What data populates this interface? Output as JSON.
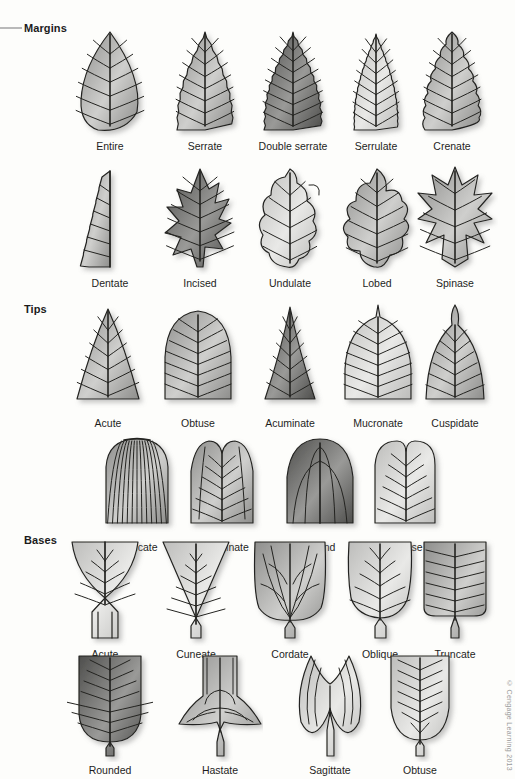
{
  "figure": {
    "background": "#fdfdfb",
    "ink": "#1d1d1d",
    "copyright": "© Cengage Learning 2013"
  },
  "sections": [
    {
      "id": "margins",
      "heading": "Margins",
      "rows": [
        {
          "id": "margins-row-1",
          "items": [
            {
              "label": "Entire",
              "shape": "entire",
              "tone": "mid"
            },
            {
              "label": "Serrate",
              "shape": "serrate",
              "tone": "mid"
            },
            {
              "label": "Double serrate",
              "shape": "doubleserrate",
              "tone": "dark"
            },
            {
              "label": "Serrulate",
              "shape": "serrulate",
              "tone": "light"
            },
            {
              "label": "Crenate",
              "shape": "crenate",
              "tone": "mid"
            }
          ]
        },
        {
          "id": "margins-row-2",
          "items": [
            {
              "label": "Dentate",
              "shape": "dentate",
              "tone": "mid"
            },
            {
              "label": "Incised",
              "shape": "incised",
              "tone": "dark"
            },
            {
              "label": "Undulate",
              "shape": "undulate",
              "tone": "light"
            },
            {
              "label": "Lobed",
              "shape": "lobed",
              "tone": "mid"
            },
            {
              "label": "Spinase",
              "shape": "spinase",
              "tone": "mid"
            }
          ]
        }
      ]
    },
    {
      "id": "tips",
      "heading": "Tips",
      "rows": [
        {
          "id": "tips-row-1",
          "items": [
            {
              "label": "Acute",
              "shape": "acute-tip",
              "tone": "mid"
            },
            {
              "label": "Obtuse",
              "shape": "obtuse-tip",
              "tone": "mid"
            },
            {
              "label": "Acuminate",
              "shape": "acuminate",
              "tone": "dark"
            },
            {
              "label": "Mucronate",
              "shape": "mucronate",
              "tone": "light"
            },
            {
              "label": "Cuspidate",
              "shape": "cuspidate",
              "tone": "mid"
            }
          ]
        },
        {
          "id": "tips-row-2",
          "items": [
            {
              "label": "Truncate",
              "shape": "truncate-tip",
              "tone": "mid"
            },
            {
              "label": "Emarginate",
              "shape": "emarginate",
              "tone": "mid"
            },
            {
              "label": "Round",
              "shape": "round-tip",
              "tone": "dark"
            },
            {
              "label": "Retuse",
              "shape": "retuse",
              "tone": "light"
            }
          ]
        }
      ]
    },
    {
      "id": "bases",
      "heading": "Bases",
      "rows": [
        {
          "id": "bases-row-1",
          "items": [
            {
              "label": "Acute",
              "shape": "acute-base",
              "tone": "light"
            },
            {
              "label": "Cuneate",
              "shape": "cuneate",
              "tone": "light"
            },
            {
              "label": "Cordate",
              "shape": "cordate",
              "tone": "mid"
            },
            {
              "label": "Oblique",
              "shape": "oblique",
              "tone": "light"
            },
            {
              "label": "Truncate",
              "shape": "truncate-base",
              "tone": "mid"
            }
          ]
        },
        {
          "id": "bases-row-2",
          "items": [
            {
              "label": "Rounded",
              "shape": "rounded-base",
              "tone": "dark"
            },
            {
              "label": "Hastate",
              "shape": "hastate",
              "tone": "mid"
            },
            {
              "label": "Sagittate",
              "shape": "sagittate",
              "tone": "light"
            },
            {
              "label": "Obtuse",
              "shape": "obtuse-base",
              "tone": "light"
            }
          ]
        }
      ]
    }
  ]
}
